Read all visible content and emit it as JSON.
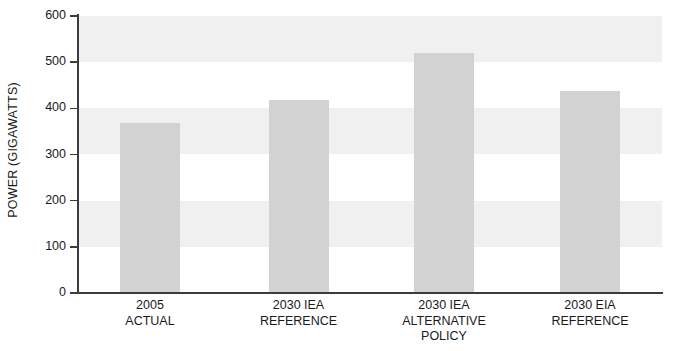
{
  "chart_data": {
    "type": "bar",
    "title": "",
    "subtitle": "",
    "xlabel": "",
    "ylabel": "POWER (GIGAWATTS)",
    "categories": [
      "2005\nACTUAL",
      "2030 IEA\nREFERENCE",
      "2030 IEA\nALTERNATIVE\nPOLICY",
      "2030 EIA\nREFERENCE"
    ],
    "category_lines": [
      [
        "2005",
        "ACTUAL"
      ],
      [
        "2030 IEA",
        "REFERENCE"
      ],
      [
        "2030 IEA",
        "ALTERNATIVE",
        "POLICY"
      ],
      [
        "2030 EIA",
        "REFERENCE"
      ]
    ],
    "values": [
      368,
      418,
      520,
      437
    ],
    "ylim": [
      0,
      600
    ],
    "ytick_labels": [
      "600",
      "500",
      "400",
      "300",
      "200",
      "100",
      "0"
    ],
    "ytick_values": [
      600,
      500,
      400,
      300,
      200,
      100,
      0
    ],
    "grid": false,
    "banding": true,
    "band_ranges": [
      [
        500,
        600
      ],
      [
        300,
        400
      ],
      [
        100,
        200
      ]
    ],
    "legend": null,
    "bar_color": "#d2d2d2",
    "band_color": "#f0f0f0",
    "axis_color": "#3c3c3c",
    "text_color": "#1a1a1a",
    "background": "#ffffff"
  }
}
